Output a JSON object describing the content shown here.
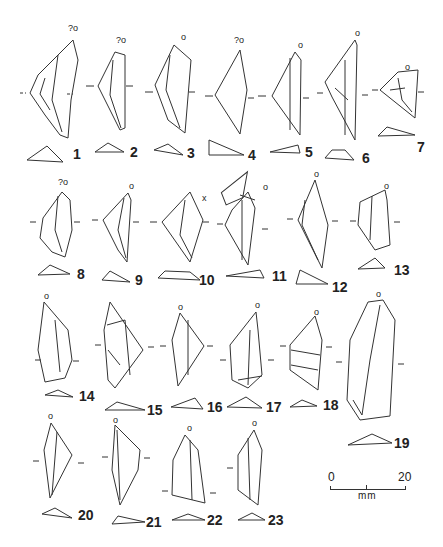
{
  "figure": {
    "type": "archaeological lithic artifact plate",
    "artifacts": [
      {
        "n": "1",
        "label": "1",
        "top": "?o"
      },
      {
        "n": "2",
        "label": "2",
        "top": "?o"
      },
      {
        "n": "3",
        "label": "3",
        "top": "o"
      },
      {
        "n": "4",
        "label": "4",
        "top": "?o"
      },
      {
        "n": "5",
        "label": "5",
        "top": "o"
      },
      {
        "n": "6",
        "label": "6",
        "top": "o"
      },
      {
        "n": "7",
        "label": "7",
        "top": "o"
      },
      {
        "n": "8",
        "label": "8",
        "top": "?o"
      },
      {
        "n": "9",
        "label": "9",
        "top": "o"
      },
      {
        "n": "10",
        "label": "10",
        "top": "x"
      },
      {
        "n": "11",
        "label": "11",
        "top": "o"
      },
      {
        "n": "12",
        "label": "12",
        "top": "o"
      },
      {
        "n": "13",
        "label": "13",
        "top": "o"
      },
      {
        "n": "14",
        "label": "14",
        "top": "o"
      },
      {
        "n": "15",
        "label": "15",
        "top": ""
      },
      {
        "n": "16",
        "label": "16",
        "top": "o"
      },
      {
        "n": "17",
        "label": "17",
        "top": "o"
      },
      {
        "n": "18",
        "label": "18",
        "top": "o"
      },
      {
        "n": "19",
        "label": "19",
        "top": "o"
      },
      {
        "n": "20",
        "label": "20",
        "top": "o"
      },
      {
        "n": "21",
        "label": "21",
        "top": "o"
      },
      {
        "n": "22",
        "label": "22",
        "top": "o"
      },
      {
        "n": "23",
        "label": "23",
        "top": "o"
      }
    ],
    "scale_bar": {
      "start": "0",
      "end": "20",
      "unit": "mm"
    }
  }
}
